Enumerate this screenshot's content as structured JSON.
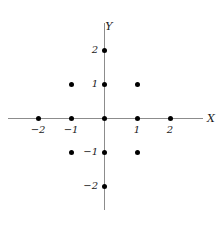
{
  "figure": {
    "width": 219,
    "height": 229,
    "background": "#ffffff",
    "point_color": "#000000",
    "axis_color": "#8c8c8c",
    "label_color": "#1a1a1a"
  },
  "axes": {
    "x_name": "X",
    "y_name": "Y",
    "x_tick_labels": [
      "−2",
      "−1",
      "1",
      "2"
    ],
    "y_tick_labels": [
      "2",
      "1",
      "−1",
      "−2"
    ]
  },
  "chart_data": {
    "type": "scatter",
    "title": "",
    "xlabel": "X",
    "ylabel": "Y",
    "xlim": [
      -2.9,
      3.0
    ],
    "ylim": [
      -2.7,
      2.8
    ],
    "grid": false,
    "legend": null,
    "x_ticks": [
      -2,
      -1,
      1,
      2
    ],
    "y_ticks": [
      2,
      1,
      -1,
      -2
    ],
    "x_tick_labels": [
      "−2",
      "−1",
      "1",
      "2"
    ],
    "y_tick_labels": [
      "2",
      "1",
      "−1",
      "−2"
    ],
    "series": [
      {
        "name": "lattice points",
        "marker": "filled-circle",
        "color": "#000000",
        "points": [
          {
            "x": 0,
            "y": 2
          },
          {
            "x": -1,
            "y": 1
          },
          {
            "x": 0,
            "y": 1
          },
          {
            "x": 1,
            "y": 1
          },
          {
            "x": -2,
            "y": 0
          },
          {
            "x": -1,
            "y": 0
          },
          {
            "x": 0,
            "y": 0
          },
          {
            "x": 1,
            "y": 0
          },
          {
            "x": 2,
            "y": 0
          },
          {
            "x": -1,
            "y": -1
          },
          {
            "x": 0,
            "y": -1
          },
          {
            "x": 1,
            "y": -1
          },
          {
            "x": 0,
            "y": -2
          }
        ]
      }
    ],
    "point_count": 13
  }
}
